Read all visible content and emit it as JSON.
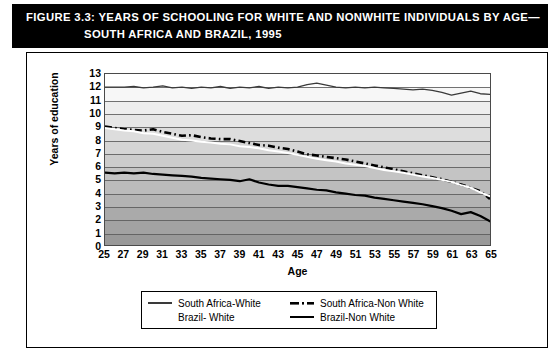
{
  "title": {
    "figure_label": "FIGURE 3.3:",
    "line1": "YEARS OF SCHOOLING FOR WHITE AND NONWHITE INDIVIDUALS BY AGE—",
    "line2": "SOUTH AFRICA AND BRAZIL, 1995"
  },
  "chart_data": {
    "type": "line",
    "xlabel": "Age",
    "ylabel": "Years of education",
    "xlim": [
      25,
      65
    ],
    "ylim": [
      0,
      13
    ],
    "grid": true,
    "legend_position": "bottom",
    "xticks": [
      25,
      27,
      29,
      31,
      33,
      35,
      37,
      39,
      41,
      43,
      45,
      47,
      49,
      51,
      53,
      55,
      57,
      59,
      61,
      63,
      65
    ],
    "yticks": [
      0,
      1,
      2,
      3,
      4,
      5,
      6,
      7,
      8,
      9,
      10,
      11,
      12,
      13
    ],
    "x": [
      25,
      26,
      27,
      28,
      29,
      30,
      31,
      32,
      33,
      34,
      35,
      36,
      37,
      38,
      39,
      40,
      41,
      42,
      43,
      44,
      45,
      46,
      47,
      48,
      49,
      50,
      51,
      52,
      53,
      54,
      55,
      56,
      57,
      58,
      59,
      60,
      61,
      62,
      63,
      64,
      65
    ],
    "series": [
      {
        "name": "South Africa-White",
        "style": "solid-thin-dark",
        "color": "#3a3a3a",
        "values": [
          12.0,
          12.0,
          12.0,
          12.05,
          11.95,
          12.0,
          12.1,
          11.95,
          12.0,
          11.9,
          12.0,
          11.95,
          12.05,
          11.9,
          12.0,
          11.95,
          12.05,
          11.9,
          12.0,
          11.95,
          12.0,
          12.2,
          12.3,
          12.15,
          12.0,
          11.95,
          12.0,
          11.95,
          12.0,
          11.95,
          11.9,
          11.85,
          11.8,
          11.85,
          11.75,
          11.6,
          11.4,
          11.55,
          11.7,
          11.5,
          11.45
        ]
      },
      {
        "name": "South Africa-Non White",
        "style": "dash-dot-thick-black",
        "color": "#000000",
        "values": [
          9.0,
          8.9,
          8.8,
          8.75,
          8.7,
          8.8,
          8.6,
          8.45,
          8.3,
          8.35,
          8.2,
          8.1,
          8.05,
          8.05,
          7.9,
          7.75,
          7.6,
          7.55,
          7.4,
          7.3,
          7.1,
          6.9,
          6.8,
          6.7,
          6.6,
          6.5,
          6.35,
          6.2,
          6.05,
          5.9,
          5.75,
          5.6,
          5.45,
          5.3,
          5.15,
          5.0,
          4.8,
          4.6,
          4.35,
          4.1,
          3.5
        ]
      },
      {
        "name": "Brazil- White",
        "style": "solid-white",
        "color": "#ffffff",
        "values": [
          8.9,
          8.8,
          8.7,
          8.65,
          8.5,
          8.45,
          8.3,
          8.15,
          8.0,
          7.95,
          7.85,
          7.8,
          7.7,
          7.65,
          7.5,
          7.45,
          7.35,
          7.2,
          7.1,
          7.0,
          6.85,
          6.7,
          6.55,
          6.45,
          6.35,
          6.2,
          6.1,
          6.0,
          5.85,
          5.7,
          5.6,
          5.5,
          5.35,
          5.2,
          5.1,
          4.95,
          4.8,
          4.55,
          4.35,
          4.0,
          3.7
        ]
      },
      {
        "name": "Brazil-Non White",
        "style": "solid-thick-black",
        "color": "#000000",
        "values": [
          5.5,
          5.45,
          5.5,
          5.45,
          5.5,
          5.4,
          5.35,
          5.3,
          5.25,
          5.2,
          5.1,
          5.05,
          5.0,
          4.95,
          4.85,
          5.0,
          4.75,
          4.6,
          4.5,
          4.5,
          4.4,
          4.3,
          4.2,
          4.15,
          4.0,
          3.9,
          3.8,
          3.75,
          3.6,
          3.5,
          3.4,
          3.3,
          3.2,
          3.1,
          2.95,
          2.8,
          2.6,
          2.35,
          2.5,
          2.2,
          1.8
        ]
      }
    ]
  },
  "legend": {
    "entries": [
      {
        "label": "South Africa-White",
        "swatch": "thin-line-gray"
      },
      {
        "label": "South Africa-Non White",
        "swatch": "dash-dot-line-black"
      },
      {
        "label": "Brazil- White",
        "swatch": "thin-line-white"
      },
      {
        "label": "Brazil-Non White",
        "swatch": "thick-line-black"
      }
    ]
  }
}
